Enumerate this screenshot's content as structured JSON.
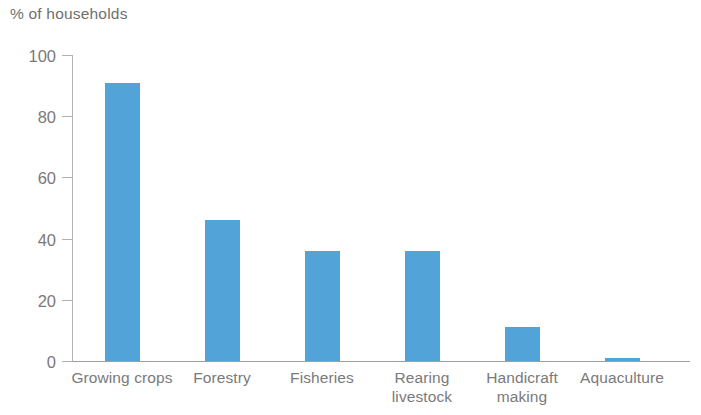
{
  "chart_data": {
    "type": "bar",
    "title": "% of households",
    "xlabel": "",
    "ylabel": "% of households",
    "categories": [
      "Growing crops",
      "Forestry",
      "Fisheries",
      "Rearing\nlivestock",
      "Handicraft\nmaking",
      "Aquaculture"
    ],
    "values": [
      91,
      46,
      36,
      36,
      11,
      1
    ],
    "ylim": [
      0,
      100
    ],
    "yticks": [
      0,
      20,
      40,
      60,
      80,
      100
    ],
    "ytick_labels": [
      "0",
      "20",
      "40",
      "60",
      "80",
      "100"
    ],
    "grid": false,
    "legend": null,
    "bar_color": "#52a3d7",
    "axis_color": "#9e9e9e",
    "text_color": "#7a7a7a"
  },
  "layout": {
    "axis_x_px": 72,
    "baseline_y_px": 361,
    "top_y_px": 55,
    "bar_width_px": 35,
    "bar_centers_px": [
      122,
      222,
      322,
      422,
      522,
      622
    ]
  }
}
